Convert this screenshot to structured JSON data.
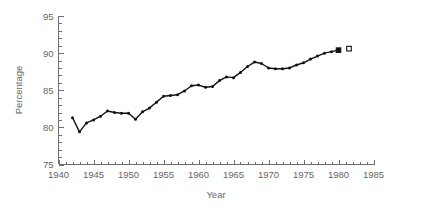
{
  "chart_data": {
    "type": "line",
    "title": "",
    "subtitle": "",
    "xlabel": "Year",
    "ylabel": "Percentage",
    "xlim": [
      1940,
      1985
    ],
    "ylim": [
      75,
      95
    ],
    "xticks": [
      1940,
      1945,
      1950,
      1955,
      1960,
      1965,
      1970,
      1975,
      1980,
      1985
    ],
    "yticks": [
      75,
      80,
      85,
      90,
      95
    ],
    "xtick_labels": [
      "1940",
      "1945",
      "1950",
      "1955",
      "1960",
      "1965",
      "1970",
      "1975",
      "1980",
      "1985"
    ],
    "ytick_labels": [
      "75",
      "80",
      "85",
      "90",
      "95"
    ],
    "minor_tick_interval_x": 1,
    "minor_tick_interval_y": 1,
    "grid": false,
    "legend": null,
    "legend_position": "none",
    "line_color": "#111111",
    "axis_color": "#6e6e6e",
    "text_color": "#666666",
    "background_color": "#ffffff",
    "marker": "filled-circle",
    "x": [
      1942,
      1943,
      1944,
      1945,
      1946,
      1947,
      1948,
      1949,
      1950,
      1951,
      1952,
      1953,
      1954,
      1955,
      1956,
      1957,
      1958,
      1959,
      1960,
      1961,
      1962,
      1963,
      1964,
      1965,
      1966,
      1967,
      1968,
      1969,
      1970,
      1971,
      1972,
      1973,
      1974,
      1975,
      1976,
      1977,
      1978,
      1979,
      1980
    ],
    "values": [
      81.3,
      79.4,
      80.6,
      81.0,
      81.5,
      82.2,
      82.0,
      81.9,
      81.9,
      81.1,
      82.1,
      82.6,
      83.4,
      84.2,
      84.3,
      84.4,
      84.9,
      85.6,
      85.7,
      85.4,
      85.5,
      86.3,
      86.8,
      86.7,
      87.4,
      88.2,
      88.8,
      88.6,
      88.0,
      87.9,
      87.9,
      88.0,
      88.4,
      88.7,
      89.2,
      89.6,
      90.0,
      90.2,
      90.4
    ],
    "end_markers": [
      {
        "name": "series-end-filled",
        "x": 1980,
        "y": 90.4,
        "style": "filled-square"
      },
      {
        "name": "projection-open",
        "x": 1981.5,
        "y": 90.6,
        "style": "open-square"
      }
    ]
  }
}
